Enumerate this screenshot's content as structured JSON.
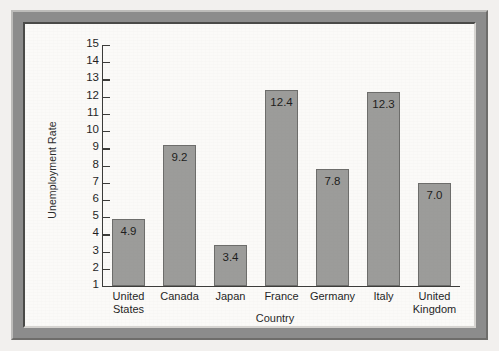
{
  "chart_data": {
    "type": "bar",
    "title": "",
    "xlabel": "Country",
    "ylabel": "Unemployment Rate",
    "categories": [
      "United States",
      "Canada",
      "Japan",
      "France",
      "Germany",
      "Italy",
      "United Kingdom"
    ],
    "values": [
      4.9,
      9.2,
      3.4,
      12.4,
      7.8,
      12.3,
      7.0
    ],
    "value_labels": [
      "4.9",
      "9.2",
      "3.4",
      "12.4",
      "7.8",
      "12.3",
      "7.0"
    ],
    "ylim": [
      1,
      15
    ],
    "ytick_labels": [
      "15",
      "14",
      "13",
      "12",
      "11",
      "10",
      "9",
      "8",
      "7",
      "6",
      "5",
      "4",
      "3",
      "2",
      "1"
    ],
    "yticks": [
      15,
      14,
      13,
      12,
      11,
      10,
      9,
      8,
      7,
      6,
      5,
      4,
      3,
      2,
      1
    ],
    "grid": false,
    "legend": false,
    "legend_position": "none",
    "bar_color": "#9c9c9a",
    "bar_border_color": "#6d6d6b",
    "axis_color": "#3b3b39",
    "text_color": "#1f1f1f",
    "background_color": "#fbfaf8"
  },
  "frame": {
    "outer_color": "#8c8c8c",
    "page_color": "#f2f0ee"
  }
}
